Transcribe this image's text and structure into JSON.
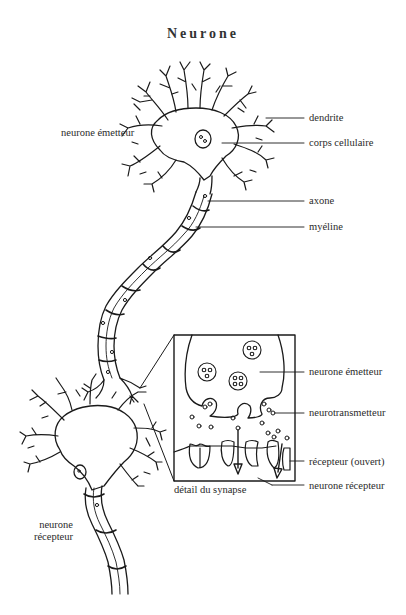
{
  "title": "Neurone",
  "labels": {
    "sender_neuron": "neurone émetteur",
    "dendrite": "dendrite",
    "cell_body": "corps cellulaire",
    "axon": "axone",
    "myelin": "myéline",
    "receiver_neuron_line1": "neurone",
    "receiver_neuron_line2": "récepteur"
  },
  "synapse_detail": {
    "caption": "détail du synapse",
    "labels": {
      "sender_neuron": "neurone émetteur",
      "neurotransmitter": "neurotransmetteur",
      "receptor_open": "récepteur (ouvert)",
      "receiver_neuron": "neurone récepteur"
    }
  }
}
